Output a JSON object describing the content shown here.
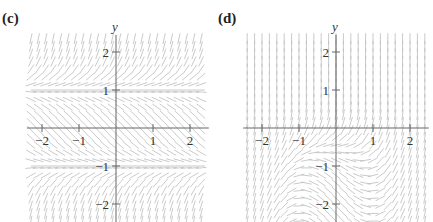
{
  "panels": [
    {
      "id": "c",
      "label": "(c)",
      "x_axis_label": "t",
      "y_axis_label": "y",
      "x_ticks": [
        {
          "value": -2,
          "label": "−2"
        },
        {
          "value": -1,
          "label": "−1"
        },
        {
          "value": 1,
          "label": "1"
        },
        {
          "value": 2,
          "label": "2"
        }
      ],
      "y_ticks": [
        {
          "value": 2,
          "label": "2"
        },
        {
          "value": 1,
          "label": "1"
        },
        {
          "value": -1,
          "label": "−1"
        },
        {
          "value": -2,
          "label": "−2"
        }
      ],
      "field": "y^2 - 1",
      "equilibria": [
        1,
        -1
      ],
      "origin_px": [
        116,
        128
      ],
      "unit_px": [
        37,
        38
      ],
      "t_range": [
        -2.3,
        2.4
      ],
      "y_range": [
        -2.45,
        2.4
      ]
    },
    {
      "id": "d",
      "label": "(d)",
      "x_axis_label": "t",
      "y_axis_label": "y",
      "x_ticks": [
        {
          "value": -2,
          "label": "−2"
        },
        {
          "value": -1,
          "label": "−1"
        },
        {
          "value": 1,
          "label": "1"
        },
        {
          "value": 2,
          "label": "2"
        }
      ],
      "y_ticks": [
        {
          "value": 2,
          "label": "2"
        },
        {
          "value": 1,
          "label": "1"
        },
        {
          "value": -1,
          "label": "−1"
        },
        {
          "value": -2,
          "label": "−2"
        }
      ],
      "field": "t^2 - 1 + 3e^(2y)",
      "equilibria": [],
      "origin_px": [
        120,
        128
      ],
      "unit_px": [
        37,
        38
      ],
      "t_range": [
        -2.4,
        2.4
      ],
      "y_range": [
        -2.45,
        2.4
      ]
    }
  ],
  "style": {
    "field_color": "#bdbdbd",
    "axis_color": "#666666",
    "equilibrium_color": "#c8c8c8"
  }
}
